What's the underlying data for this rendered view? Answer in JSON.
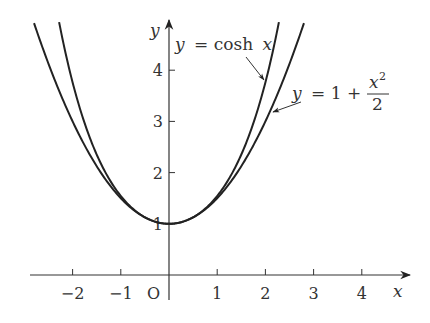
{
  "chart_data": {
    "type": "line",
    "title": "",
    "xlabel": "x",
    "ylabel": "y",
    "origin_label": "O",
    "xlim": [
      -2.8,
      4.8
    ],
    "ylim": [
      0,
      5
    ],
    "grid": false,
    "x_ticks": [
      -2,
      -1,
      1,
      2,
      3,
      4
    ],
    "x_tick_labels": [
      "−2",
      "−1",
      "1",
      "2",
      "3",
      "4"
    ],
    "y_ticks": [
      1,
      2,
      3,
      4
    ],
    "y_tick_labels": [
      "1",
      "2",
      "3",
      "4"
    ],
    "series": [
      {
        "name": "y = cosh x",
        "formula": "cosh(x)",
        "x": [
          -2.28,
          -2,
          -1.5,
          -1,
          -0.5,
          0,
          0.5,
          1,
          1.5,
          2,
          2.28
        ],
        "values": [
          4.94,
          3.76,
          2.35,
          1.54,
          1.13,
          1.0,
          1.13,
          1.54,
          2.35,
          3.76,
          4.94
        ]
      },
      {
        "name": "y = 1 + x²/2",
        "formula": "1 + x^2/2",
        "x": [
          -2.8,
          -2,
          -1.5,
          -1,
          -0.5,
          0,
          0.5,
          1,
          1.5,
          2,
          2.8
        ],
        "values": [
          4.92,
          3.0,
          2.125,
          1.5,
          1.125,
          1.0,
          1.125,
          1.5,
          2.125,
          3.0,
          4.92
        ]
      }
    ],
    "annotations": [
      {
        "text_parts": [
          "y",
          " = cosh ",
          "x"
        ],
        "target_series": "y = cosh x"
      },
      {
        "text_parts": [
          "y",
          " = 1 + ",
          "x",
          "2",
          "2"
        ],
        "target_series": "y = 1 + x²/2"
      }
    ]
  },
  "labels": {
    "x_axis": "x",
    "y_axis": "y",
    "origin": "O",
    "cosh_y": "y",
    "cosh_eq": "= cosh",
    "cosh_x": "x",
    "para_y": "y",
    "para_eq": "= 1 +",
    "para_num_x": "x",
    "para_num_exp": "2",
    "para_den": "2"
  }
}
